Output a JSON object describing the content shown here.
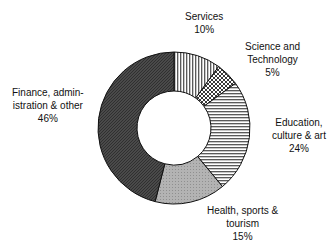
{
  "chart_data": {
    "type": "pie",
    "variant": "donut",
    "title": "",
    "categories": [
      "Services",
      "Science and Technology",
      "Education, culture & art",
      "Health, sports & tourism",
      "Finance, administration & other"
    ],
    "values": [
      10,
      5,
      24,
      15,
      46
    ],
    "unit": "%",
    "start_angle": "12 o'clock",
    "direction": "clockwise",
    "legend": "none (direct labels)",
    "slices": [
      {
        "label_lines": [
          "Services",
          "10%"
        ],
        "value": 10,
        "fill": "vertical-hatch"
      },
      {
        "label_lines": [
          "Science and",
          "Technology",
          "5%"
        ],
        "value": 5,
        "fill": "crosshatch"
      },
      {
        "label_lines": [
          "Education,",
          "culture & art",
          "24%"
        ],
        "value": 24,
        "fill": "horizontal-hatch"
      },
      {
        "label_lines": [
          "Health, sports &",
          "tourism",
          "15%"
        ],
        "value": 15,
        "fill": "light-gray"
      },
      {
        "label_lines": [
          "Finance, admin-",
          "istration & other",
          "46%"
        ],
        "value": 46,
        "fill": "dark-gray"
      }
    ]
  },
  "labels": {
    "services": {
      "l1": "Services",
      "pct": "10%"
    },
    "science": {
      "l1": "Science and",
      "l2": "Technology",
      "pct": "5%"
    },
    "education": {
      "l1": "Education,",
      "l2": "culture & art",
      "pct": "24%"
    },
    "health": {
      "l1": "Health, sports &",
      "l2": "tourism",
      "pct": "15%"
    },
    "finance": {
      "l1": "Finance, admin-",
      "l2": "istration & other",
      "pct": "46%"
    }
  }
}
